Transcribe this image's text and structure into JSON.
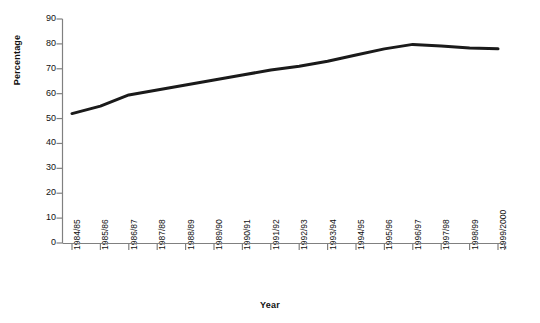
{
  "chart_data": {
    "type": "line",
    "title": "",
    "xlabel": "Year",
    "ylabel": "Percentage",
    "ylim": [
      0,
      90
    ],
    "yticks": [
      0,
      10,
      20,
      30,
      40,
      50,
      60,
      70,
      80,
      90
    ],
    "grid": false,
    "legend": "none",
    "line_color": "#1a1a1a",
    "line_width": 3,
    "categories": [
      "1984/85",
      "1985/86",
      "1986/87",
      "1987/88",
      "1988/89",
      "1989/90",
      "1990/91",
      "1991/92",
      "1992/93",
      "1993/94",
      "1994/95",
      "1995/96",
      "1996/97",
      "1997/98",
      "1998/99",
      "1999/2000"
    ],
    "values": [
      52,
      55,
      59.5,
      61.5,
      63.5,
      65.5,
      67.5,
      69.5,
      71,
      73,
      75.5,
      78,
      79.8,
      79.2,
      78.3,
      78
    ]
  },
  "axes": {
    "y_axis_color": "#808080",
    "x_axis_color": "#808080"
  }
}
